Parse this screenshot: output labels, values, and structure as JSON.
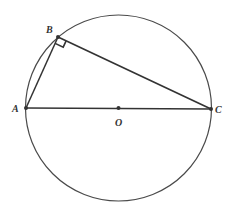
{
  "diagram": {
    "type": "geometry",
    "colors": {
      "stroke": "#3a3a3a",
      "background": "#ffffff"
    },
    "circle": {
      "center_label": "O",
      "cx": 118.5,
      "cy": 108,
      "r": 93
    },
    "points": {
      "A": {
        "label": "A",
        "x": 26,
        "y": 108
      },
      "B": {
        "label": "B",
        "x": 58,
        "y": 37
      },
      "C": {
        "label": "C",
        "x": 211,
        "y": 109
      },
      "O": {
        "label": "O",
        "x": 118.5,
        "y": 108
      }
    },
    "segments": [
      {
        "from": "A",
        "to": "B"
      },
      {
        "from": "B",
        "to": "C"
      },
      {
        "from": "A",
        "to": "C"
      }
    ],
    "right_angle_marker": {
      "at": "B"
    }
  }
}
